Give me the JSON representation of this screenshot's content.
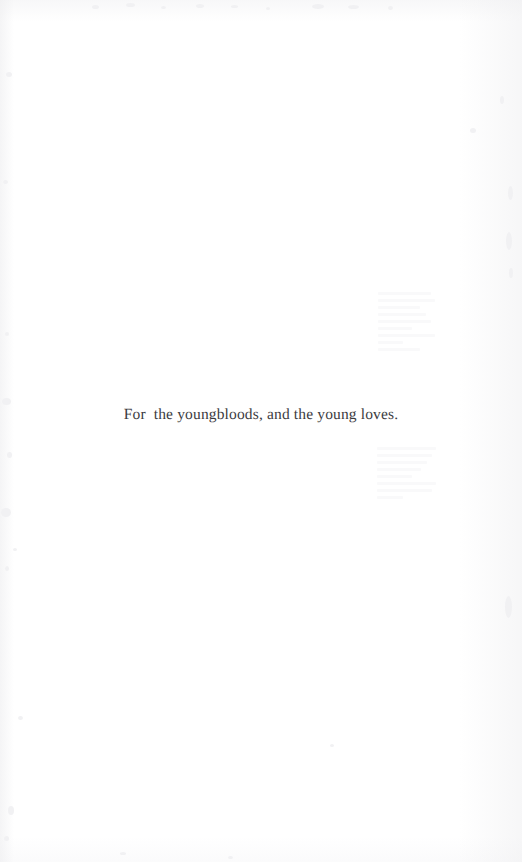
{
  "page": {
    "kind": "book-dedication-page",
    "background_color": "#ffffff",
    "width": 522,
    "height": 862
  },
  "dedication": {
    "text": "For  the youngbloods, and the young loves.",
    "color": "#3b3b41",
    "alignment": "center"
  },
  "artifacts": {
    "ghost_upper_label": "",
    "ghost_lower_label": "",
    "note": ""
  }
}
